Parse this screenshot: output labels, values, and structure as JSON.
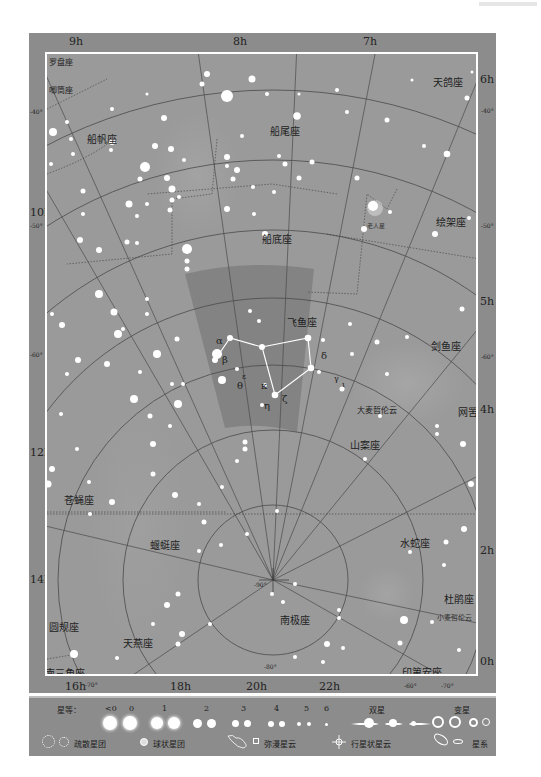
{
  "hour_labels": {
    "top": [
      "9h",
      "8h",
      "7h"
    ],
    "right": [
      "6h",
      "5h",
      "4h",
      "2h",
      "0h"
    ],
    "left": [
      "10h",
      "12h",
      "14h"
    ],
    "bottom": [
      "16h",
      "18h",
      "20h",
      "22h"
    ]
  },
  "declination_labels": {
    "left": [
      "-40°",
      "-50°",
      "-60°"
    ],
    "right": [
      "-40°",
      "-50°",
      "-60°"
    ],
    "bottom": [
      "-70°",
      "-60°",
      "-70°"
    ],
    "inner": [
      "-90°",
      "-80°"
    ]
  },
  "constellations": {
    "pyxis": "罗盘座",
    "antlia": "唧筒座",
    "vela": "船帆座",
    "puppis": "船尾座",
    "columba": "天鸽座",
    "carina": "船底座",
    "pictor": "绘架座",
    "volans": "飞鱼座",
    "dorado": "剑鱼座",
    "reticulum": "网罟座",
    "mensa": "山案座",
    "musca": "苍蝇座",
    "chamaeleon": "蝘蜓座",
    "hydrus": "水蛇座",
    "octans": "南极座",
    "tucana": "杜鹃座",
    "circinus": "圆规座",
    "apus": "天燕座",
    "triangulum_australe": "南三角座",
    "indus": "印第安座"
  },
  "objects": {
    "canopus": "老人星",
    "lmc": "大麦哲伦云",
    "smc": "小麦哲伦云"
  },
  "greek_letters": {
    "alpha": "α",
    "beta": "β",
    "epsilon": "ε",
    "delta": "δ",
    "gamma": "γ",
    "iota": "ι",
    "theta": "θ",
    "kappa": "κ",
    "zeta": "ζ",
    "eta": "η"
  },
  "legend": {
    "magnitude_title": "星等：",
    "magnitudes": [
      "<0",
      "0",
      "1",
      "2",
      "3",
      "4",
      "5",
      "6"
    ],
    "double_star": "双星",
    "variable_star": "变星",
    "open_cluster": "疏散星团",
    "globular_cluster": "球状星团",
    "diffuse_nebula": "弥漫星云",
    "planetary_nebula": "行星状星云",
    "galaxy": "星系"
  },
  "colors": {
    "frame": "#8c8c8c",
    "chart_bg": "#9a9a9a",
    "volans_highlight": "#7f7f7f",
    "star": "#ffffff",
    "grid_line": "#4a4a4a"
  }
}
